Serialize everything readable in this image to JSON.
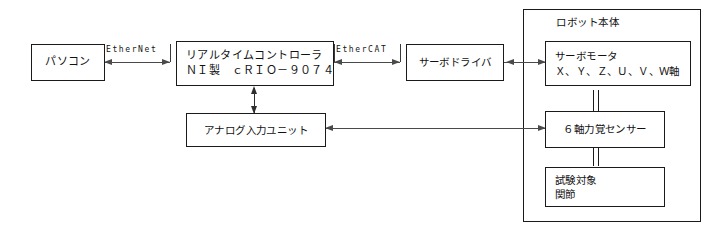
{
  "diagram": {
    "title": "",
    "background_color": "#ffffff",
    "line_color": "#1a1a1a",
    "text_color": "#111111",
    "nodes": {
      "pc": {
        "label": "パソコン"
      },
      "realtime_controller": {
        "line1": "リアルタイムコントローラ",
        "line2": "ＮＩ製　ｃＲＩＯ－９０７４"
      },
      "analog_input_unit": {
        "label": "アナログ入力ユニット"
      },
      "servo_driver": {
        "label": "サーボドライバ"
      },
      "servo_motor": {
        "line1": "サーボモータ",
        "line2": "Ｘ、Ｙ、Ｚ、Ｕ、Ｖ、Ｗ軸"
      },
      "force_sensor": {
        "label": "６軸力覚センサー"
      },
      "test_target": {
        "line1": "試験対象",
        "line2": "関節"
      }
    },
    "container": {
      "robot_body": {
        "title": "ロボット本体"
      }
    },
    "connections": {
      "ethernet": {
        "label": "EtherNet"
      },
      "ethercat": {
        "label": "EtherCAT"
      }
    }
  }
}
